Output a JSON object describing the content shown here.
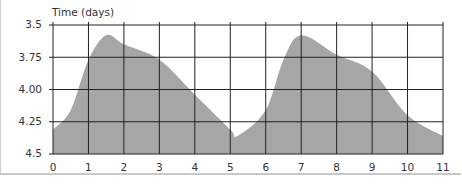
{
  "chart_data": {
    "type": "area",
    "title": "",
    "xlabel": "",
    "ylabel": "Time (days)",
    "x": [
      0,
      0.5,
      1,
      1.5,
      2,
      3,
      4,
      5,
      5.2,
      6,
      6.5,
      7,
      8,
      9,
      10,
      11
    ],
    "values": [
      4.31,
      4.16,
      3.77,
      3.58,
      3.65,
      3.77,
      4.04,
      4.31,
      4.36,
      4.16,
      3.77,
      3.58,
      3.73,
      3.86,
      4.2,
      4.36
    ],
    "y_inverted": true,
    "ylim": [
      3.5,
      4.5
    ],
    "xlim": [
      0,
      11
    ],
    "y_ticks": [
      "3.5",
      "3.75",
      "4.00",
      "4.25",
      "4.5"
    ],
    "x_ticks": [
      "0",
      "1",
      "2",
      "3",
      "4",
      "5",
      "6",
      "7",
      "8",
      "9",
      "10",
      "11"
    ],
    "grid": true,
    "fill_color": "#a6a6a6",
    "grid_color": "#222222"
  }
}
